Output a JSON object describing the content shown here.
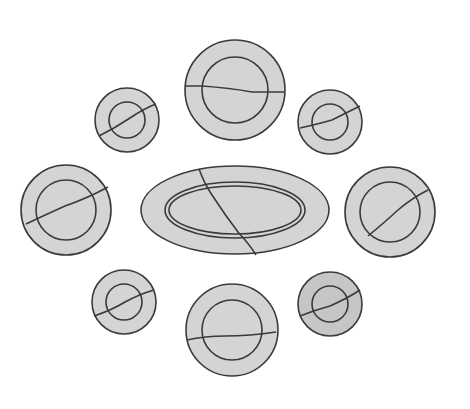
{
  "image": {
    "description": "Line drawing of broken plates arranged around a cracked oval platter",
    "colors": {
      "fill": "#d4d4d4",
      "stroke": "#3a3a3a",
      "background": "#ffffff"
    },
    "platter": {
      "cx": 235,
      "cy": 210,
      "rx": 94,
      "ry": 44,
      "inner_rx": 68,
      "inner_ry": 26
    },
    "plates": [
      {
        "name": "top-center",
        "cx": 235,
        "cy": 90,
        "r": 50,
        "inner": 32
      },
      {
        "name": "top-left",
        "cx": 127,
        "cy": 120,
        "r": 32,
        "inner": 18
      },
      {
        "name": "top-right",
        "cx": 330,
        "cy": 122,
        "r": 32,
        "inner": 18
      },
      {
        "name": "mid-left",
        "cx": 66,
        "cy": 210,
        "r": 45,
        "inner": 30
      },
      {
        "name": "mid-right",
        "cx": 390,
        "cy": 212,
        "r": 45,
        "inner": 30
      },
      {
        "name": "bottom-left",
        "cx": 124,
        "cy": 302,
        "r": 32,
        "inner": 18
      },
      {
        "name": "bottom-right",
        "cx": 330,
        "cy": 304,
        "r": 32,
        "inner": 18
      },
      {
        "name": "bottom-center",
        "cx": 232,
        "cy": 330,
        "r": 46,
        "inner": 30
      }
    ]
  }
}
